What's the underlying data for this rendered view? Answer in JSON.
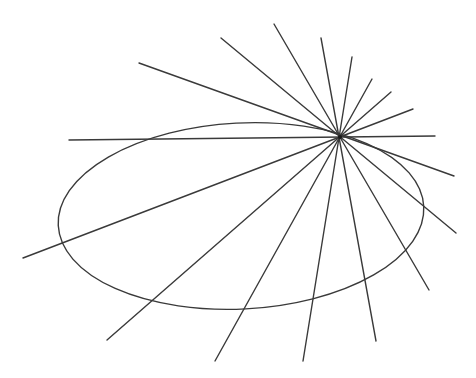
{
  "diagram": {
    "stroke_color": "#3a3a3a",
    "background": "#ffffff",
    "center": {
      "x": 340,
      "y": 137
    },
    "ellipse": {
      "cx": 241,
      "cy": 216,
      "rx": 183,
      "ry": 93,
      "rotate": -3
    },
    "rays": [
      {
        "x1": 139,
        "y1": 63,
        "x2": 454,
        "y2": 176
      },
      {
        "x1": 221,
        "y1": 38,
        "x2": 456,
        "y2": 233
      },
      {
        "x1": 274,
        "y1": 24,
        "x2": 429,
        "y2": 290
      },
      {
        "x1": 321,
        "y1": 38,
        "x2": 376,
        "y2": 341
      },
      {
        "x1": 352,
        "y1": 57,
        "x2": 303,
        "y2": 361
      },
      {
        "x1": 372,
        "y1": 79,
        "x2": 215,
        "y2": 361
      },
      {
        "x1": 391,
        "y1": 92,
        "x2": 107,
        "y2": 340
      },
      {
        "x1": 413,
        "y1": 109,
        "x2": 23,
        "y2": 258
      },
      {
        "x1": 435,
        "y1": 136,
        "x2": 69,
        "y2": 140
      }
    ]
  }
}
